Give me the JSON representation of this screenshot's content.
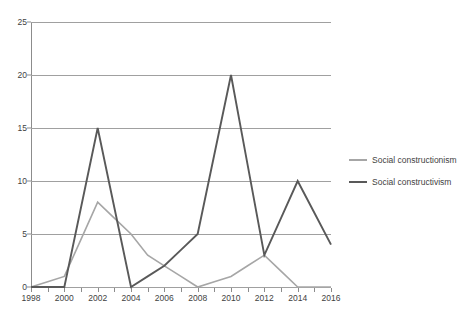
{
  "chart_data": {
    "type": "line",
    "title": "",
    "subtitle": "",
    "xlabel": "",
    "ylabel": "",
    "x": [
      1998,
      1999,
      2000,
      2001,
      2002,
      2003,
      2004,
      2005,
      2006,
      2007,
      2008,
      2009,
      2010,
      2011,
      2012,
      2013,
      2014,
      2015,
      2016
    ],
    "xlim": [
      1998,
      2016
    ],
    "ylim": [
      0,
      25
    ],
    "x_tick_labels": [
      "1998",
      "2000",
      "2002",
      "2004",
      "2006",
      "2008",
      "2010",
      "2012",
      "2014",
      "2016"
    ],
    "x_tick_values": [
      1998,
      2000,
      2002,
      2004,
      2006,
      2008,
      2010,
      2012,
      2014,
      2016
    ],
    "y_tick_labels": [
      "0",
      "5",
      "10",
      "15",
      "20",
      "25"
    ],
    "y_tick_values": [
      0,
      5,
      10,
      15,
      20,
      25
    ],
    "grid": "horizontal",
    "legend_position": "right",
    "series": [
      {
        "name": "Social constructionism",
        "color": "#a6a6a6",
        "values": [
          0,
          0.5,
          1,
          4.5,
          8,
          6.5,
          5,
          3,
          2,
          1,
          0,
          0.5,
          1,
          2,
          3,
          1.5,
          0,
          0,
          0
        ]
      },
      {
        "name": "Social constructivism",
        "color": "#595959",
        "values": [
          0,
          0,
          0,
          7.5,
          15,
          7.5,
          0,
          1,
          2,
          3.5,
          5,
          12.5,
          20,
          11.5,
          3,
          6.5,
          10,
          7,
          4
        ]
      }
    ]
  },
  "legend": {
    "entries": [
      {
        "label": "Social constructionism",
        "color": "#a6a6a6",
        "thickness": "2px"
      },
      {
        "label": "Social constructivism",
        "color": "#595959",
        "thickness": "2.5px"
      }
    ]
  },
  "axes": {
    "y_axis_color": "#8c8c8c",
    "grid_color": "#a0a0a0",
    "tick_label_color": "#3f3f3f"
  }
}
